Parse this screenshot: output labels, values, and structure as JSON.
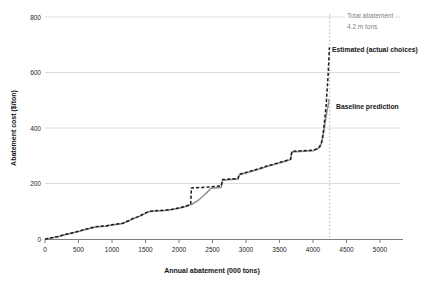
{
  "chart": {
    "y_title": "Abatement cost ($/ton)",
    "x_title": "Annual abatement (000 tons)",
    "annotations": {
      "total_line1": "Total abatement",
      "total_line2": "4.2 m tons",
      "estimated": "Estimated (actual choices)",
      "baseline": "Baseline prediction"
    },
    "colors": {
      "estimated_line": "#1a1a1a",
      "baseline_line": "#8f8f8f",
      "gridline": "#dcdcdc",
      "axis": "#7f7f7f",
      "reference_line": "#b0b0b0",
      "annotation_gray": "#7f7f7f",
      "text": "#262626"
    }
  },
  "chart_data": {
    "type": "line",
    "title": "",
    "xlabel": "Annual abatement (000 tons)",
    "ylabel": "Abatement cost ($/ton)",
    "xlim": [
      0,
      5000
    ],
    "ylim": [
      0,
      800
    ],
    "x_ticks": [
      0,
      500,
      1000,
      1500,
      2000,
      2500,
      3000,
      3500,
      4000,
      4500,
      5000
    ],
    "y_ticks": [
      0,
      200,
      400,
      600,
      800
    ],
    "grid": "horizontal",
    "legend_position": "end-of-line-labels",
    "reference_line": {
      "x": 4250,
      "style": "dotted",
      "label": "Total abatement 4.2 m tons"
    },
    "series": [
      {
        "name": "Baseline prediction",
        "style": "solid",
        "color": "#8f8f8f",
        "points": [
          [
            0,
            0
          ],
          [
            30,
            1
          ],
          [
            80,
            3
          ],
          [
            130,
            5
          ],
          [
            180,
            7
          ],
          [
            230,
            11
          ],
          [
            280,
            14
          ],
          [
            330,
            17
          ],
          [
            400,
            21
          ],
          [
            470,
            25
          ],
          [
            540,
            30
          ],
          [
            620,
            35
          ],
          [
            700,
            40
          ],
          [
            780,
            44
          ],
          [
            900,
            46
          ],
          [
            1000,
            50
          ],
          [
            1080,
            53
          ],
          [
            1160,
            56
          ],
          [
            1200,
            60
          ],
          [
            1260,
            66
          ],
          [
            1310,
            73
          ],
          [
            1370,
            78
          ],
          [
            1420,
            83
          ],
          [
            1470,
            89
          ],
          [
            1520,
            95
          ],
          [
            1570,
            99
          ],
          [
            1650,
            101
          ],
          [
            1800,
            103
          ],
          [
            1900,
            106
          ],
          [
            2000,
            111
          ],
          [
            2100,
            117
          ],
          [
            2200,
            126
          ],
          [
            2280,
            138
          ],
          [
            2350,
            152
          ],
          [
            2410,
            166
          ],
          [
            2450,
            176
          ],
          [
            2480,
            183
          ],
          [
            2630,
            186
          ],
          [
            2650,
            212
          ],
          [
            2880,
            216
          ],
          [
            2900,
            231
          ],
          [
            3000,
            238
          ],
          [
            3100,
            245
          ],
          [
            3200,
            252
          ],
          [
            3300,
            260
          ],
          [
            3400,
            267
          ],
          [
            3500,
            274
          ],
          [
            3600,
            281
          ],
          [
            3665,
            286
          ],
          [
            3685,
            314
          ],
          [
            4000,
            318
          ],
          [
            4060,
            323
          ],
          [
            4100,
            331
          ],
          [
            4130,
            347
          ],
          [
            4150,
            372
          ],
          [
            4170,
            402
          ],
          [
            4190,
            432
          ],
          [
            4210,
            462
          ],
          [
            4225,
            480
          ],
          [
            4240,
            505
          ]
        ]
      },
      {
        "name": "Estimated (actual choices)",
        "style": "dashed",
        "color": "#1a1a1a",
        "points": [
          [
            0,
            0
          ],
          [
            30,
            1
          ],
          [
            80,
            4
          ],
          [
            130,
            6
          ],
          [
            180,
            8
          ],
          [
            230,
            12
          ],
          [
            280,
            15
          ],
          [
            330,
            18
          ],
          [
            400,
            22
          ],
          [
            470,
            26
          ],
          [
            540,
            31
          ],
          [
            620,
            36
          ],
          [
            700,
            41
          ],
          [
            780,
            45
          ],
          [
            900,
            47
          ],
          [
            1000,
            51
          ],
          [
            1080,
            54
          ],
          [
            1160,
            57
          ],
          [
            1200,
            61
          ],
          [
            1260,
            67
          ],
          [
            1310,
            74
          ],
          [
            1370,
            79
          ],
          [
            1420,
            84
          ],
          [
            1470,
            90
          ],
          [
            1520,
            96
          ],
          [
            1570,
            100
          ],
          [
            1650,
            102
          ],
          [
            1800,
            104
          ],
          [
            1900,
            107
          ],
          [
            2000,
            112
          ],
          [
            2100,
            118
          ],
          [
            2160,
            124
          ],
          [
            2175,
            127
          ],
          [
            2185,
            184
          ],
          [
            2350,
            186
          ],
          [
            2480,
            188
          ],
          [
            2630,
            191
          ],
          [
            2650,
            214
          ],
          [
            2880,
            218
          ],
          [
            2900,
            233
          ],
          [
            3000,
            240
          ],
          [
            3100,
            247
          ],
          [
            3200,
            254
          ],
          [
            3300,
            262
          ],
          [
            3400,
            269
          ],
          [
            3500,
            276
          ],
          [
            3600,
            283
          ],
          [
            3665,
            288
          ],
          [
            3685,
            316
          ],
          [
            4000,
            320
          ],
          [
            4060,
            325
          ],
          [
            4100,
            333
          ],
          [
            4130,
            350
          ],
          [
            4150,
            378
          ],
          [
            4165,
            410
          ],
          [
            4180,
            445
          ],
          [
            4195,
            480
          ],
          [
            4205,
            515
          ],
          [
            4215,
            550
          ],
          [
            4225,
            590
          ],
          [
            4235,
            635
          ],
          [
            4245,
            690
          ]
        ]
      }
    ]
  }
}
